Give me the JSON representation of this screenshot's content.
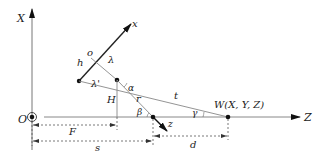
{
  "diagram": {
    "axes": {
      "X": "X",
      "Z": "Z",
      "x": "x",
      "z": "z",
      "origin": "O"
    },
    "points": {
      "o": "o",
      "h": "h",
      "W": "W(X, Y, Z)"
    },
    "angles": {
      "alpha": "α",
      "beta": "β",
      "gamma": "γ"
    },
    "segments": {
      "lambda": "λ",
      "lambda_prime": "λ'",
      "H": "H",
      "r": "r",
      "t": "t",
      "F": "F",
      "s": "s",
      "d": "d"
    },
    "colors": {
      "line": "#8a8a8a",
      "axis": "#222222",
      "dim": "#555555"
    }
  }
}
